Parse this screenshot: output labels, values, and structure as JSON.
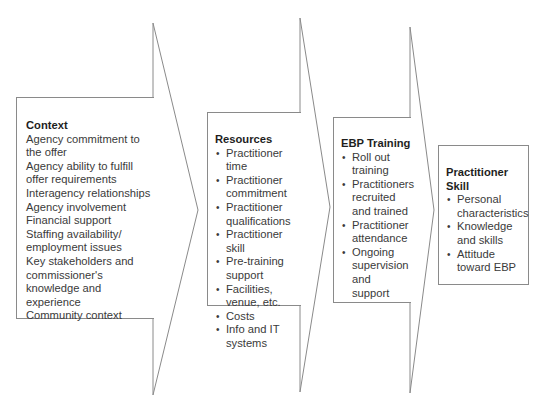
{
  "diagram": {
    "type": "chevron-flow",
    "colors": {
      "stroke": "#8a8a8a",
      "text": "#3a3a3a",
      "heading": "#1e1e1e",
      "background": "#ffffff"
    },
    "stages": [
      {
        "heading": "Context",
        "items": [
          "Agency commitment to the offer",
          "Agency ability to fulfill offer requirements",
          "Interagency relationships",
          "Agency involvement",
          "Financial support",
          "Staffing availability/ employment issues",
          "Key stakeholders and commissioner's knowledge and experience",
          "Community context"
        ]
      },
      {
        "heading": "Resources",
        "items": [
          "Practitioner time",
          "Practitioner commitment",
          "Practitioner qualifications",
          "Practitioner skill",
          "Pre-training support",
          "Facilities, venue, etc.",
          "Costs",
          "Info and IT systems"
        ]
      },
      {
        "heading": "EBP Training",
        "items": [
          "Roll out training",
          "Practitioners recruited and trained",
          "Practitioner attendance",
          "Ongoing supervision and support"
        ]
      },
      {
        "heading": "Practitioner Skill",
        "items": [
          "Personal characteristics",
          "Knowledge and skills",
          "Attitude toward EBP"
        ]
      }
    ]
  }
}
